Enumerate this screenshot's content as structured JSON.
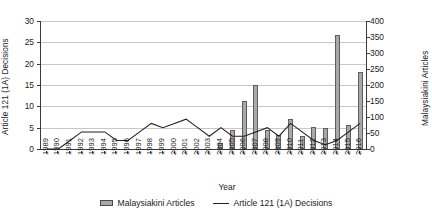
{
  "chart_data": {
    "type": "bar",
    "title": "",
    "xlabel": "Year",
    "categories": [
      "1989",
      "1990",
      "1991",
      "1992",
      "1993",
      "1994",
      "1995",
      "1996",
      "1997",
      "1998",
      "1999",
      "2000",
      "2001",
      "2002",
      "2003",
      "2004",
      "2005",
      "2006",
      "2007",
      "2008",
      "2009",
      "2010",
      "2011",
      "2012",
      "2013",
      "2014",
      "2015",
      "2016"
    ],
    "grid": true,
    "legend_position": "bottom",
    "axes": {
      "left": {
        "label": "Article 121 (1A) Decisions",
        "min": 0,
        "max": 30,
        "step": 5,
        "ticks": [
          "0",
          "5",
          "10",
          "15",
          "20",
          "25",
          "30"
        ]
      },
      "right": {
        "label": "Malaysiakini Articles",
        "min": 0,
        "max": 400,
        "step": 50,
        "ticks": [
          "0",
          "50",
          "100",
          "150",
          "200",
          "250",
          "300",
          "350",
          "400"
        ]
      }
    },
    "series": [
      {
        "name": "Malaysiakini Articles",
        "kind": "bar",
        "axis": "right",
        "color": "#a9a9a9",
        "edge_color": "#5e5e5e",
        "values": [
          0,
          0,
          0,
          0,
          0,
          0,
          0,
          0,
          0,
          0,
          0,
          0,
          0,
          0,
          0,
          20,
          60,
          150,
          200,
          60,
          45,
          95,
          40,
          70,
          65,
          355,
          75,
          240
        ]
      },
      {
        "name": "Article 121 (1A) Decisions",
        "kind": "line",
        "axis": "left",
        "color": "#202020",
        "values": [
          0,
          0,
          2,
          4,
          4,
          4,
          2,
          2,
          4,
          6,
          5,
          6,
          7,
          5,
          3,
          5,
          3,
          3,
          4,
          5,
          3,
          6,
          4,
          2,
          1,
          2,
          4,
          6
        ]
      }
    ]
  },
  "legend": {
    "items": [
      {
        "label": "Malaysiakini Articles",
        "marker": "bar-swatch"
      },
      {
        "label": "Article 121 (1A) Decisions",
        "marker": "line-swatch"
      }
    ]
  }
}
